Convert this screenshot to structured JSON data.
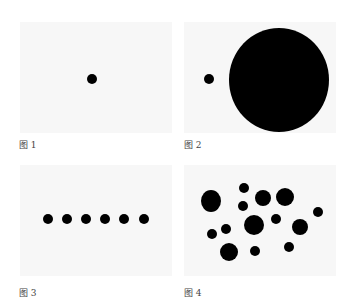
{
  "figures": [
    {
      "caption": "图 1",
      "panel": {
        "x": 20,
        "y": 22,
        "w": 152,
        "h": 111
      },
      "caption_pos": {
        "x": 19,
        "y": 138
      },
      "circles": [
        {
          "cx": 92,
          "cy": 79,
          "rx": 5,
          "ry": 5
        }
      ]
    },
    {
      "caption": "图 2",
      "panel": {
        "x": 184,
        "y": 22,
        "w": 152,
        "h": 111
      },
      "caption_pos": {
        "x": 184,
        "y": 138
      },
      "circles": [
        {
          "cx": 209,
          "cy": 79,
          "rx": 5,
          "ry": 5
        },
        {
          "cx": 279,
          "cy": 80,
          "rx": 50,
          "ry": 52
        }
      ]
    },
    {
      "caption": "图 3",
      "panel": {
        "x": 20,
        "y": 165,
        "w": 152,
        "h": 111
      },
      "caption_pos": {
        "x": 19,
        "y": 286
      },
      "circles": [
        {
          "cx": 48,
          "cy": 219,
          "rx": 5,
          "ry": 5
        },
        {
          "cx": 67,
          "cy": 219,
          "rx": 5,
          "ry": 5
        },
        {
          "cx": 86,
          "cy": 219,
          "rx": 5,
          "ry": 5
        },
        {
          "cx": 105,
          "cy": 219,
          "rx": 5,
          "ry": 5
        },
        {
          "cx": 124,
          "cy": 219,
          "rx": 5,
          "ry": 5
        },
        {
          "cx": 144,
          "cy": 219,
          "rx": 5,
          "ry": 5
        }
      ]
    },
    {
      "caption": "图 4",
      "panel": {
        "x": 184,
        "y": 165,
        "w": 152,
        "h": 111
      },
      "caption_pos": {
        "x": 184,
        "y": 286
      },
      "circles": [
        {
          "cx": 211,
          "cy": 201,
          "rx": 10,
          "ry": 11
        },
        {
          "cx": 244,
          "cy": 188,
          "rx": 5,
          "ry": 5
        },
        {
          "cx": 263,
          "cy": 198,
          "rx": 8,
          "ry": 8
        },
        {
          "cx": 285,
          "cy": 197,
          "rx": 9,
          "ry": 9
        },
        {
          "cx": 243,
          "cy": 206,
          "rx": 5,
          "ry": 5
        },
        {
          "cx": 318,
          "cy": 212,
          "rx": 5,
          "ry": 5
        },
        {
          "cx": 254,
          "cy": 225,
          "rx": 10,
          "ry": 10
        },
        {
          "cx": 276,
          "cy": 219,
          "rx": 5,
          "ry": 5
        },
        {
          "cx": 300,
          "cy": 227,
          "rx": 8,
          "ry": 8
        },
        {
          "cx": 212,
          "cy": 234,
          "rx": 5,
          "ry": 5
        },
        {
          "cx": 226,
          "cy": 229,
          "rx": 5,
          "ry": 5
        },
        {
          "cx": 229,
          "cy": 252,
          "rx": 9,
          "ry": 9
        },
        {
          "cx": 255,
          "cy": 251,
          "rx": 5,
          "ry": 5
        },
        {
          "cx": 289,
          "cy": 247,
          "rx": 5,
          "ry": 5
        }
      ]
    }
  ],
  "colors": {
    "dot": "#000000",
    "panel_bg": "#f7f7f7",
    "caption": "#444444"
  }
}
